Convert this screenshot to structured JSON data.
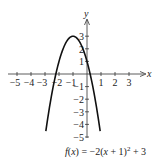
{
  "chart_data": {
    "type": "line",
    "title": "",
    "function_label": "f(x) = −2(x + 1)² + 3",
    "xlabel": "x",
    "ylabel": "y",
    "xlim": [
      -5,
      3
    ],
    "ylim": [
      -5,
      3
    ],
    "x_ticks": [
      -5,
      -4,
      -3,
      -2,
      -1,
      1,
      2,
      3
    ],
    "y_ticks": [
      -5,
      -4,
      -3,
      -2,
      -1,
      1,
      2,
      3
    ],
    "grid": false,
    "series": [
      {
        "name": "f(x) = -2(x+1)^2 + 3",
        "x": [
          -2.94,
          -2.5,
          -2.22,
          -2,
          -1.5,
          -1,
          -0.5,
          0,
          0.22,
          0.5,
          0.94
        ],
        "y": [
          -4.5,
          -1.5,
          0,
          1,
          2.5,
          3,
          2.5,
          1,
          0,
          -1.5,
          -4.5
        ]
      }
    ],
    "vertex": [
      -1,
      3
    ],
    "x_intercepts": [
      -2.22,
      0.22
    ],
    "y_intercept": 1
  },
  "labels": {
    "x_axis": "x",
    "y_axis": "y",
    "caption_prefix": "f(x) = −2(x + 1)",
    "caption_exp": "2",
    "caption_suffix": " + 3",
    "x_tick_labels": [
      "−5",
      "−4",
      "−3",
      "−2",
      "−1",
      "1",
      "2",
      "3"
    ],
    "y_tick_labels": [
      "3",
      "2",
      "1",
      "−1",
      "−2",
      "−3",
      "−4",
      "−5"
    ]
  }
}
